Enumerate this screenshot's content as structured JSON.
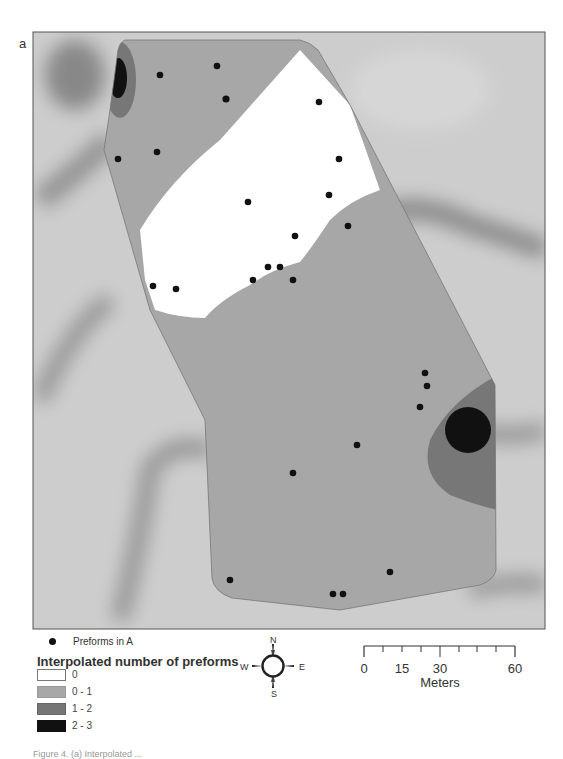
{
  "figure": {
    "panel_label": "a",
    "caption_partial": "Figure 4. (a) Interpolated ..."
  },
  "map": {
    "frame": {
      "x": 33,
      "y": 32,
      "width": 512,
      "height": 597
    },
    "colors": {
      "background_hillshade": "#c8c8c8",
      "class_0": "#ffffff",
      "class_0_1": "#a7a7a7",
      "class_1_2": "#767676",
      "class_2_3": "#111111",
      "point": "#111111"
    },
    "preform_points": [
      {
        "x": 160,
        "y": 75
      },
      {
        "x": 217,
        "y": 66
      },
      {
        "x": 226,
        "y": 99
      },
      {
        "x": 118,
        "y": 159
      },
      {
        "x": 157,
        "y": 152
      },
      {
        "x": 319,
        "y": 102
      },
      {
        "x": 339,
        "y": 159
      },
      {
        "x": 329,
        "y": 195
      },
      {
        "x": 348,
        "y": 226
      },
      {
        "x": 248,
        "y": 202
      },
      {
        "x": 295,
        "y": 236
      },
      {
        "x": 268,
        "y": 267
      },
      {
        "x": 280,
        "y": 267
      },
      {
        "x": 253,
        "y": 280
      },
      {
        "x": 293,
        "y": 280
      },
      {
        "x": 153,
        "y": 286
      },
      {
        "x": 176,
        "y": 289
      },
      {
        "x": 425,
        "y": 373
      },
      {
        "x": 427,
        "y": 386
      },
      {
        "x": 420,
        "y": 407
      },
      {
        "x": 357,
        "y": 445
      },
      {
        "x": 293,
        "y": 473
      },
      {
        "x": 230,
        "y": 580
      },
      {
        "x": 390,
        "y": 572
      },
      {
        "x": 333,
        "y": 594
      },
      {
        "x": 343,
        "y": 594
      }
    ]
  },
  "legend": {
    "point_label": "Preforms in A",
    "title": "Interpolated number of preforms",
    "classes": [
      {
        "label": "0",
        "color": "#ffffff"
      },
      {
        "label": "0 - 1",
        "color": "#a7a7a7"
      },
      {
        "label": "1 - 2",
        "color": "#767676"
      },
      {
        "label": "2 - 3",
        "color": "#111111"
      }
    ]
  },
  "north_arrow": {
    "n": "N",
    "s": "S",
    "e": "E",
    "w": "W"
  },
  "scale_bar": {
    "ticks": [
      {
        "label": "0",
        "x": 4
      },
      {
        "label": "15",
        "x": 42
      },
      {
        "label": "30",
        "x": 80
      },
      {
        "label": "60",
        "x": 155
      }
    ],
    "units": "Meters"
  }
}
